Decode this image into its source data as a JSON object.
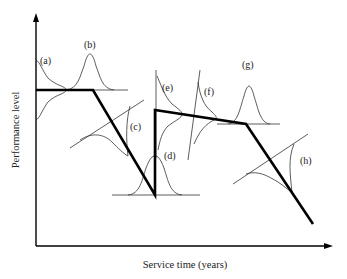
{
  "diagram": {
    "axes": {
      "y_label": "Performance level",
      "x_label": "Service time (years)"
    },
    "curve_labels": {
      "a": "(a)",
      "b": "(b)",
      "c": "(c)",
      "d": "(d)",
      "e": "(e)",
      "f": "(f)",
      "g": "(g)",
      "h": "(h)"
    },
    "performance_profile": {
      "description": "Piecewise performance level over service time: initial plateau, linear deterioration, sudden restoration (maintenance), slow deterioration, faster deterioration",
      "segments": [
        "plateau",
        "deterioration",
        "restoration",
        "slow deterioration",
        "fast deterioration"
      ]
    },
    "colors": {
      "line": "#000000",
      "thin": "#333333",
      "background": "#ffffff"
    }
  }
}
